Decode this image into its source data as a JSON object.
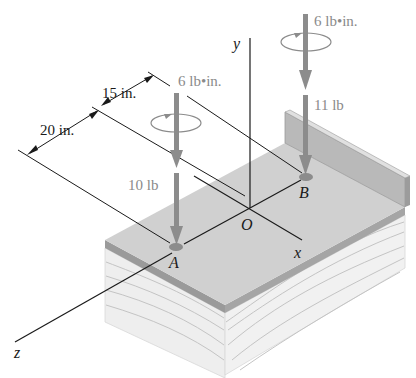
{
  "figure": {
    "type": "statics-isometric-diagram",
    "labels": {
      "dim_15": "15 in.",
      "dim_20": "20 in.",
      "couple_A": "6 lb•in.",
      "couple_B": "6 lb•in.",
      "force_A": "10 lb",
      "force_B": "11 lb",
      "axis_x": "x",
      "axis_y": "y",
      "axis_z": "z",
      "point_O": "O",
      "point_A": "A",
      "point_B": "B"
    },
    "colors": {
      "plate_top": "#cfcfcf",
      "plate_edge": "#9a9a9a",
      "wood_face": "#ededed",
      "wood_grain": "#bdbdbd",
      "arrow": "#8c8c8c",
      "line": "#1a1a1a",
      "force_text": "#8a8a8a"
    }
  }
}
